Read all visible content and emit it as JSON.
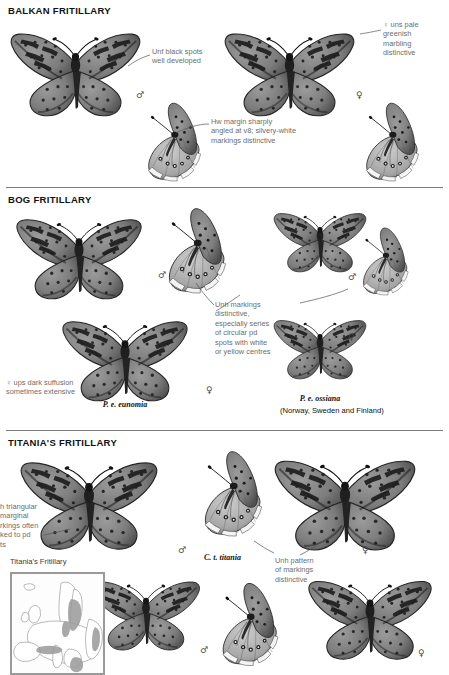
{
  "page": {
    "background": "#ffffff",
    "text_color": "#111111",
    "note_color": "#6d6d6d",
    "rule_color": "#7d7d7d"
  },
  "sections": [
    {
      "id": "balkan",
      "title": "BALKAN FRITILLARY",
      "notes": [
        {
          "id": "unf-black-spots",
          "text": "Unf black spots\nwell developed"
        },
        {
          "id": "hw-margin",
          "text": "Hw margin sharply\nangled at v8; silvery-white\nmarkings distinctive"
        },
        {
          "id": "uns-pale-greenish",
          "text": "♀ uns pale\ngreenish\nmarbling\ndistinctive"
        }
      ],
      "symbols": [
        {
          "id": "male-ups",
          "glyph": "♂"
        },
        {
          "id": "female-ups",
          "glyph": "♀"
        }
      ]
    },
    {
      "id": "bog",
      "title": "BOG FRITILLARY",
      "notes": [
        {
          "id": "unh-markings",
          "text": "Unh markings\ndistinctive,\nespecially series\nof circular pd\nspots with white\nor yellow centres"
        },
        {
          "id": "ups-dark-suffusion",
          "text": "♀ ups dark suffusion\nsometimes extensive"
        }
      ],
      "symbols": [
        {
          "id": "male-eunomia",
          "glyph": "♂"
        },
        {
          "id": "female-eunomia",
          "glyph": "♀"
        },
        {
          "id": "male-ossiana",
          "glyph": "♂"
        },
        {
          "id": "female-ossiana",
          "glyph": "♀"
        }
      ],
      "subspecies": [
        {
          "id": "eunomia",
          "name": "P. e. eunomia",
          "region": ""
        },
        {
          "id": "ossiana",
          "name": "P. e. ossiana",
          "region": "(Norway, Sweden and Finland)"
        }
      ]
    },
    {
      "id": "titania",
      "title": "TITANIA'S FRITILLARY",
      "notes": [
        {
          "id": "uph-triangular",
          "text": "ph triangular\nbmarginal\narkings often\nnked to pd\nots"
        },
        {
          "id": "unh-pattern",
          "text": "Unh pattern\nof markings\ndistinctive"
        }
      ],
      "symbols": [
        {
          "id": "male-titania-ups",
          "glyph": "♂"
        },
        {
          "id": "female-titania-ups",
          "glyph": "♀"
        },
        {
          "id": "male-titania-lower",
          "glyph": "♂"
        },
        {
          "id": "female-titania-lower",
          "glyph": "♀"
        }
      ],
      "subspecies": [
        {
          "id": "ct-titania",
          "name": "C. t. titania",
          "region": ""
        }
      ],
      "map": {
        "caption": "Titania's Fritillary",
        "range_color": "#9a9a9a",
        "land_color": "#fdfdfd",
        "border_color": "#9a9a9a"
      }
    }
  ],
  "illustrations": {
    "wing_dark": "#2a2a2a",
    "wing_mid": "#767676",
    "wing_light": "#c9c9c9",
    "body_dark": "#1c1c1c"
  }
}
